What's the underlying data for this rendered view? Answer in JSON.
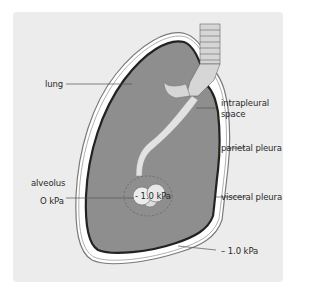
{
  "diagram": {
    "type": "anatomical-cross-section",
    "colors": {
      "background_panel": "#ececec",
      "lung_fill": "#8e8e8e",
      "visceral_pleura": "#222222",
      "intrapleural_space": "#ffffff",
      "parietal_pleura": "#7a7a7a",
      "airway": "#d6d6d6",
      "alveolus": "#e8e8e8",
      "label_text": "#2a2a2a",
      "leader_line": "#555555"
    },
    "labels": {
      "lung": "lung",
      "intrapleural_space_line1": "intrapleural",
      "intrapleural_space_line2": "space",
      "parietal_pleura": "parietal pleura",
      "alveolus": "alveolus",
      "atmospheric_pressure": "O kPa",
      "alveolar_pressure": "- 1.0 kPa",
      "visceral_pleura": "visceral pleura",
      "intrapleural_pressure": "– 1.0 kPa"
    }
  }
}
